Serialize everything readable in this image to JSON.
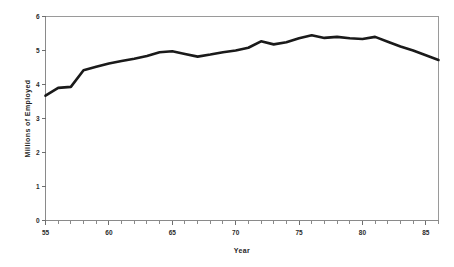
{
  "chart_data": {
    "type": "line",
    "title": "",
    "xlabel": "Year",
    "ylabel": "Millions of Employed",
    "xlim": [
      55,
      86
    ],
    "ylim": [
      0,
      6
    ],
    "grid": false,
    "legend": false,
    "legend_position": "none",
    "line_color": "#1a1a1a",
    "x_major_ticks": [
      55,
      60,
      65,
      70,
      75,
      80,
      85
    ],
    "x_major_tick_labels": [
      "55",
      "60",
      "65",
      "70",
      "75",
      "80",
      "85"
    ],
    "x_minor_tick_step": 1,
    "y_ticks": [
      0,
      1,
      2,
      3,
      4,
      5,
      6
    ],
    "y_tick_labels": [
      "0",
      "1",
      "2",
      "3",
      "4",
      "5",
      "6"
    ],
    "x": [
      55,
      56,
      57,
      58,
      59,
      60,
      61,
      62,
      63,
      64,
      65,
      66,
      67,
      68,
      69,
      70,
      71,
      72,
      73,
      74,
      75,
      76,
      77,
      78,
      79,
      80,
      81,
      82,
      83,
      84,
      85,
      86
    ],
    "values": [
      3.67,
      3.9,
      3.93,
      4.42,
      4.52,
      4.62,
      4.69,
      4.76,
      4.84,
      4.95,
      4.98,
      4.9,
      4.82,
      4.88,
      4.95,
      5.0,
      5.08,
      5.27,
      5.18,
      5.24,
      5.36,
      5.45,
      5.37,
      5.4,
      5.36,
      5.34,
      5.4,
      5.26,
      5.12,
      5.0,
      4.86,
      4.72
    ],
    "series": [
      {
        "name": "Millions of Employed",
        "values": [
          3.67,
          3.9,
          3.93,
          4.42,
          4.52,
          4.62,
          4.69,
          4.76,
          4.84,
          4.95,
          4.98,
          4.9,
          4.82,
          4.88,
          4.95,
          5.0,
          5.08,
          5.27,
          5.18,
          5.24,
          5.36,
          5.45,
          5.37,
          5.4,
          5.36,
          5.34,
          5.4,
          5.26,
          5.12,
          5.0,
          4.86,
          4.72
        ]
      }
    ]
  }
}
